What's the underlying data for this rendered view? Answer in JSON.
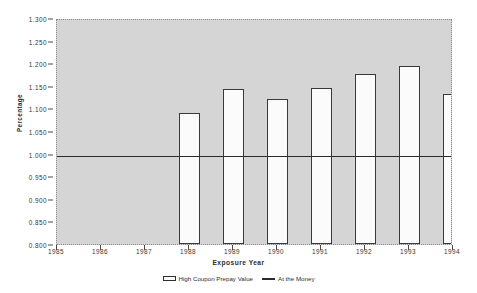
{
  "chart_data": {
    "type": "bar",
    "title": "",
    "xlabel": "Exposure  Year",
    "ylabel": "Percentage",
    "categories": [
      "1985",
      "1986",
      "1987",
      "1988",
      "1989",
      "1990",
      "1991",
      "1992",
      "1993",
      "1994"
    ],
    "series": [
      {
        "name": "High Coupon Prepay Value",
        "type": "bar",
        "values": [
          null,
          null,
          null,
          1.09,
          1.142,
          1.121,
          1.146,
          1.177,
          1.193,
          1.131
        ]
      },
      {
        "name": "At the Money",
        "type": "line",
        "constant_value": 1.0
      }
    ],
    "ylim": [
      0.8,
      1.3
    ],
    "ytick_labels": [
      "1.300",
      "1.250",
      "1.200",
      "1.150",
      "1.100",
      "1.050",
      "1.000",
      "0.950",
      "0.900",
      "0.850",
      "0.800"
    ],
    "ytick_values": [
      1.3,
      1.25,
      1.2,
      1.15,
      1.1,
      1.05,
      1.0,
      0.95,
      0.9,
      0.85,
      0.8
    ],
    "xtick_labels": [
      "1985",
      "1986",
      "1987",
      "1988",
      "1989",
      "1990",
      "1991",
      "1992",
      "1993",
      "1994"
    ],
    "grid": false,
    "legend_position": "bottom",
    "plot_background": "#d5d5d5",
    "bar_fill": "#fbfbfb",
    "bar_edge": "#3a3a3a",
    "line_color": "#2b2b2b",
    "note": "The 1994 bar is clipped by the right edge of the plot frame."
  },
  "legend": {
    "items": [
      {
        "label": "High Coupon Prepay Value",
        "marker": "box-swatch"
      },
      {
        "label": "At the Money",
        "marker": "line-swatch"
      }
    ]
  }
}
